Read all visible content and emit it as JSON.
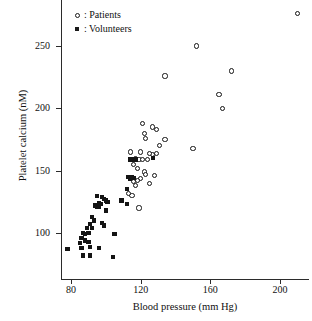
{
  "chart_data": {
    "type": "scatter",
    "title": "",
    "xlabel": "Blood pressure (mm Hg)",
    "ylabel": "Platelet calcium (nM)",
    "xlim": [
      75,
      215
    ],
    "ylim": [
      75,
      280
    ],
    "xticks": [
      80,
      120,
      160,
      200
    ],
    "yticks": [
      100,
      150,
      200,
      250
    ],
    "grid": false,
    "legend_position": "top-left",
    "series": [
      {
        "name": "Patients",
        "marker": "open-circle",
        "color": "#141414",
        "points": [
          [
            210,
            276
          ],
          [
            152,
            250
          ],
          [
            134,
            226
          ],
          [
            172,
            230
          ],
          [
            165,
            211
          ],
          [
            167,
            200
          ],
          [
            150,
            168
          ],
          [
            134,
            175
          ],
          [
            131,
            170
          ],
          [
            129,
            183
          ],
          [
            127,
            185
          ],
          [
            121,
            188
          ],
          [
            122,
            180
          ],
          [
            123,
            176
          ],
          [
            129,
            164
          ],
          [
            127,
            163
          ],
          [
            125,
            164
          ],
          [
            120,
            165
          ],
          [
            114,
            165
          ],
          [
            117,
            160
          ],
          [
            119,
            159
          ],
          [
            121,
            159
          ],
          [
            124,
            159
          ],
          [
            116,
            155
          ],
          [
            118,
            152
          ],
          [
            128,
            146
          ],
          [
            125,
            140
          ],
          [
            122,
            149
          ],
          [
            123,
            147
          ],
          [
            120,
            144
          ],
          [
            118,
            142
          ],
          [
            116,
            141
          ],
          [
            117,
            138
          ],
          [
            115,
            130
          ],
          [
            113,
            132
          ],
          [
            119,
            120
          ]
        ]
      },
      {
        "name": "Volunteers",
        "marker": "filled-square",
        "color": "#141414",
        "points": [
          [
            114,
            159
          ],
          [
            116,
            159
          ],
          [
            117,
            159
          ],
          [
            127,
            160
          ],
          [
            113,
            145
          ],
          [
            114,
            145
          ],
          [
            115,
            145
          ],
          [
            116,
            144
          ],
          [
            114,
            143
          ],
          [
            112,
            135
          ],
          [
            109,
            126
          ],
          [
            112,
            123
          ],
          [
            95,
            130
          ],
          [
            98,
            129
          ],
          [
            99,
            127
          ],
          [
            100,
            126
          ],
          [
            101,
            125
          ],
          [
            96,
            124
          ],
          [
            97,
            123
          ],
          [
            94,
            122
          ],
          [
            95,
            121
          ],
          [
            96,
            121
          ],
          [
            100,
            118
          ],
          [
            92,
            113
          ],
          [
            93,
            110
          ],
          [
            98,
            108
          ],
          [
            91,
            107
          ],
          [
            99,
            106
          ],
          [
            92,
            104
          ],
          [
            89,
            104
          ],
          [
            90,
            100
          ],
          [
            87,
            100
          ],
          [
            88,
            99
          ],
          [
            105,
            99
          ],
          [
            86,
            96
          ],
          [
            88,
            94
          ],
          [
            90,
            93
          ],
          [
            85,
            92
          ],
          [
            91,
            89
          ],
          [
            86,
            88
          ],
          [
            96,
            88
          ],
          [
            78,
            87
          ],
          [
            87,
            82
          ],
          [
            91,
            82
          ],
          [
            104,
            81
          ]
        ]
      }
    ]
  },
  "legend": {
    "items": [
      {
        "label": ": Patients",
        "marker": "open-circle"
      },
      {
        "label": ": Volunteers",
        "marker": "filled-square"
      }
    ]
  }
}
